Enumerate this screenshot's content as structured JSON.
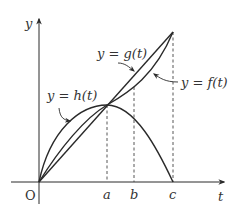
{
  "diagram": {
    "axes": {
      "x_label": "t",
      "y_label": "y",
      "origin_label": "O"
    },
    "ticks": {
      "a": "a",
      "b": "b",
      "c": "c"
    },
    "curves": {
      "g": "y = g(t)",
      "f": "y = f(t)",
      "h": "y = h(t)"
    },
    "colors": {
      "stroke": "#2a2a2a",
      "background": "#ffffff"
    }
  }
}
